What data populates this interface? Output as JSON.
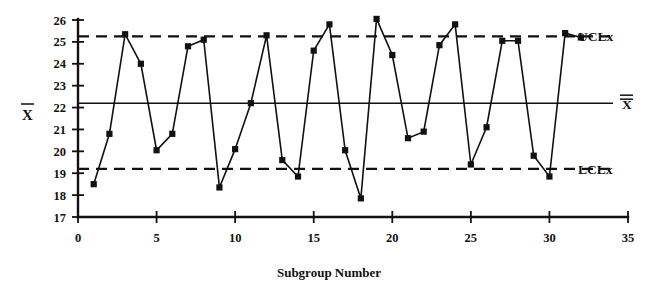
{
  "chart_data": {
    "type": "line",
    "title": "",
    "subtitle": "",
    "xlabel": "Subgroup Number",
    "ylabel": "X̄",
    "xlim": [
      0,
      35
    ],
    "ylim": [
      17,
      26
    ],
    "x_ticks": [
      0,
      5,
      10,
      15,
      20,
      25,
      30,
      35
    ],
    "x_tick_labels": [
      "0",
      "5",
      "10",
      "15",
      "20",
      "25",
      "30",
      "35"
    ],
    "y_ticks": [
      17,
      18,
      19,
      20,
      21,
      22,
      23,
      24,
      25,
      26
    ],
    "y_tick_labels": [
      "17",
      "18",
      "19",
      "20",
      "21",
      "22",
      "23",
      "24",
      "25",
      "26"
    ],
    "grid": false,
    "legend_position": "right",
    "marker": "square",
    "x": [
      1,
      2,
      3,
      4,
      5,
      6,
      7,
      8,
      9,
      10,
      11,
      12,
      13,
      14,
      15,
      16,
      17,
      18,
      19,
      20,
      21,
      22,
      23,
      24,
      25,
      26,
      27,
      28,
      29,
      30,
      31,
      32
    ],
    "series": [
      {
        "name": "X̄ subgroup average",
        "values": [
          18.5,
          20.8,
          25.35,
          24.0,
          20.05,
          20.8,
          24.8,
          25.1,
          18.35,
          20.1,
          22.2,
          25.3,
          19.6,
          18.85,
          24.6,
          25.8,
          20.05,
          17.85,
          26.05,
          24.4,
          20.6,
          20.9,
          24.85,
          25.8,
          19.4,
          21.1,
          25.05,
          25.05,
          19.8,
          18.85,
          25.4,
          25.2
        ]
      }
    ],
    "reference_lines": [
      {
        "id": "ucl",
        "label": "UCLx",
        "value": 25.25,
        "style": "dashed"
      },
      {
        "id": "center",
        "label": "X̿",
        "value": 22.2,
        "style": "solid"
      },
      {
        "id": "lcl",
        "label": "LCLx",
        "value": 19.2,
        "style": "dashed"
      }
    ]
  },
  "annotations": {
    "ucl_label": "UCLx",
    "center_label": "X",
    "lcl_label": "LCLx",
    "y_axis_label": "X"
  }
}
